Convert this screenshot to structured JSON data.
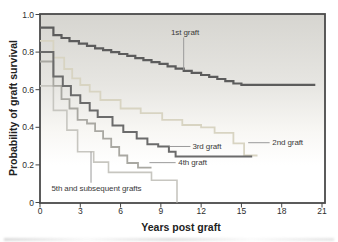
{
  "chart_data": {
    "type": "line",
    "variant": "kaplan-meier-step",
    "title": "",
    "xlabel": "Years post graft",
    "ylabel": "Probability of graft survival",
    "xlim": [
      0,
      21
    ],
    "ylim": [
      0,
      1.0
    ],
    "grid": false,
    "legend_position": "inline-curve-labels",
    "frame_color": "#4a4a4a",
    "tick_color": "#444444",
    "leader_color": "#9a9a9a",
    "axis_text_color": "#2e2e2e",
    "plot_bg_gradient": [
      "#d6d5d0",
      "#e7e6e2",
      "#f8f7f4",
      "#ffffff"
    ],
    "x_ticks": [
      {
        "v": 0,
        "label": "0"
      },
      {
        "v": 3,
        "label": "3"
      },
      {
        "v": 6,
        "label": "6"
      },
      {
        "v": 9,
        "label": "9"
      },
      {
        "v": 12,
        "label": "12"
      },
      {
        "v": 15,
        "label": "15"
      },
      {
        "v": 18,
        "label": "18"
      },
      {
        "v": 21,
        "label": "21"
      }
    ],
    "y_ticks": [
      {
        "v": 0,
        "label": "0"
      },
      {
        "v": 0.2,
        "label": "0.2"
      },
      {
        "v": 0.4,
        "label": "0.4"
      },
      {
        "v": 0.6,
        "label": "0.6"
      },
      {
        "v": 0.8,
        "label": "0.8"
      },
      {
        "v": 1.0,
        "label": "1.0"
      }
    ],
    "series": [
      {
        "name": "1st graft",
        "color": "#5c5c5c",
        "width": 2.2,
        "end_x": 20.5,
        "points": [
          [
            0,
            0.93
          ],
          [
            1,
            0.89
          ],
          [
            1.6,
            0.875
          ],
          [
            2.2,
            0.858
          ],
          [
            2.9,
            0.845
          ],
          [
            3.5,
            0.833
          ],
          [
            4.1,
            0.82
          ],
          [
            4.7,
            0.81
          ],
          [
            5.3,
            0.8
          ],
          [
            5.9,
            0.79
          ],
          [
            6.5,
            0.78
          ],
          [
            7.1,
            0.768
          ],
          [
            7.7,
            0.757
          ],
          [
            8.3,
            0.747
          ],
          [
            8.9,
            0.737
          ],
          [
            9.5,
            0.724
          ],
          [
            10.1,
            0.712
          ],
          [
            10.7,
            0.7
          ],
          [
            11.3,
            0.69
          ],
          [
            12,
            0.678
          ],
          [
            12.6,
            0.668
          ],
          [
            13.2,
            0.657
          ],
          [
            13.8,
            0.645
          ],
          [
            14.4,
            0.633
          ],
          [
            15,
            0.626
          ]
        ],
        "label": {
          "text": "1st graft",
          "x": 10.8,
          "y": 0.905,
          "anchor": "middle"
        },
        "leader": {
          "x1": 10.7,
          "y1": 0.878,
          "x2": 10.7,
          "y2": 0.705
        }
      },
      {
        "name": "2nd graft",
        "color": "#d8d4c2",
        "width": 1.8,
        "end_x": 16.2,
        "points": [
          [
            0,
            0.86
          ],
          [
            1,
            0.77
          ],
          [
            1.8,
            0.71
          ],
          [
            2.4,
            0.66
          ],
          [
            3,
            0.625
          ],
          [
            3.7,
            0.59
          ],
          [
            4.5,
            0.545
          ],
          [
            6,
            0.5
          ],
          [
            7.5,
            0.475
          ],
          [
            9.1,
            0.44
          ],
          [
            10.6,
            0.412
          ],
          [
            12,
            0.4
          ],
          [
            13,
            0.37
          ],
          [
            14.4,
            0.315
          ],
          [
            15.2,
            0.25
          ]
        ],
        "label": {
          "text": "2nd graft",
          "x": 17.3,
          "y": 0.318,
          "anchor": "start"
        },
        "leader": {
          "x1": 15.5,
          "y1": 0.318,
          "x2": 17.1,
          "y2": 0.318
        }
      },
      {
        "name": "3rd graft",
        "color": "#6b6b6b",
        "width": 2,
        "end_x": 15.8,
        "points": [
          [
            0,
            0.8
          ],
          [
            1,
            0.67
          ],
          [
            1.7,
            0.62
          ],
          [
            2.3,
            0.57
          ],
          [
            3,
            0.53
          ],
          [
            3.7,
            0.49
          ],
          [
            4.3,
            0.455
          ],
          [
            5.4,
            0.41
          ],
          [
            6.2,
            0.375
          ],
          [
            7.2,
            0.34
          ],
          [
            8,
            0.31
          ],
          [
            8.8,
            0.298
          ],
          [
            9.6,
            0.27
          ],
          [
            10.1,
            0.245
          ]
        ],
        "label": {
          "text": "3rd graft",
          "x": 11.35,
          "y": 0.3,
          "anchor": "start"
        },
        "leader": {
          "x1": 9.65,
          "y1": 0.298,
          "x2": 11.2,
          "y2": 0.298
        }
      },
      {
        "name": "4th graft",
        "color": "#a9a8a2",
        "width": 1.8,
        "end_x": 8.3,
        "points": [
          [
            0,
            0.75
          ],
          [
            1,
            0.62
          ],
          [
            1.6,
            0.55
          ],
          [
            2.2,
            0.5
          ],
          [
            2.8,
            0.44
          ],
          [
            3.5,
            0.42
          ],
          [
            4.1,
            0.38
          ],
          [
            4.7,
            0.34
          ],
          [
            5.3,
            0.295
          ],
          [
            5.9,
            0.25
          ],
          [
            6.5,
            0.21
          ],
          [
            7.3,
            0.185
          ]
        ],
        "label": {
          "text": "4th graft",
          "x": 10.3,
          "y": 0.212,
          "anchor": "start"
        },
        "leader": {
          "x1": 8.15,
          "y1": 0.212,
          "x2": 10.1,
          "y2": 0.212
        }
      },
      {
        "name": "5th and subsequent grafts",
        "color": "#c7c6c0",
        "width": 1.6,
        "end_x": 10.2,
        "points": [
          [
            0,
            0.62
          ],
          [
            1,
            0.49
          ],
          [
            2,
            0.385
          ],
          [
            2.8,
            0.27
          ],
          [
            4,
            0.215
          ],
          [
            5.1,
            0.16
          ],
          [
            8.3,
            0.118
          ],
          [
            10.2,
            0
          ]
        ],
        "label": {
          "text": "5th and subsequent grafts",
          "x": 0.85,
          "y": 0.075,
          "anchor": "start"
        },
        "leader": {
          "x1": 3.8,
          "y1": 0.105,
          "x2": 3.8,
          "y2": 0.27
        }
      }
    ]
  }
}
